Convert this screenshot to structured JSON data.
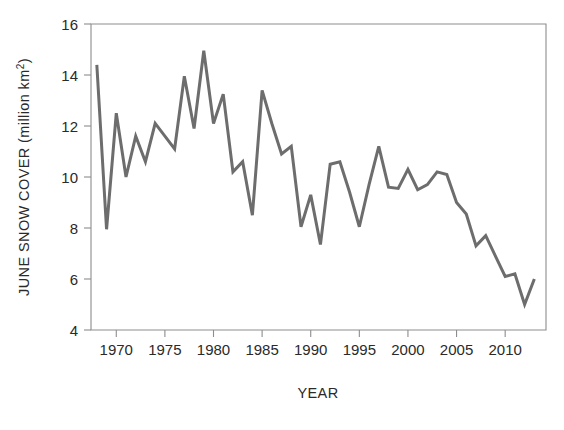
{
  "chart_data": {
    "type": "line",
    "title": "",
    "subtitle": "",
    "xlabel": "YEAR",
    "ylabel": "JUNE SNOW COVER (million km²)",
    "ylabel_main": "JUNE SNOW COVER (million km",
    "ylabel_sup": "2",
    "ylabel_tail": ")",
    "xlim": [
      1967.4,
      2014.2
    ],
    "ylim": [
      4,
      16
    ],
    "grid": false,
    "legend": null,
    "legend_position": "none",
    "line_color": "#6d6d6d",
    "line_width": 3.0,
    "frame_color": "#8d8d8d",
    "background_color": "#ffffff",
    "xticks": [
      1970,
      1975,
      1980,
      1985,
      1990,
      1995,
      2000,
      2005,
      2010
    ],
    "xtick_labels": [
      "1970",
      "1975",
      "1980",
      "1985",
      "1990",
      "1995",
      "2000",
      "2005",
      "2010"
    ],
    "yticks": [
      4,
      6,
      8,
      10,
      12,
      14,
      16
    ],
    "ytick_labels": [
      "4",
      "6",
      "8",
      "10",
      "12",
      "14",
      "16"
    ],
    "x": [
      1968,
      1969,
      1970,
      1971,
      1972,
      1973,
      1974,
      1975,
      1976,
      1977,
      1978,
      1979,
      1980,
      1981,
      1982,
      1983,
      1984,
      1985,
      1986,
      1987,
      1988,
      1989,
      1990,
      1991,
      1992,
      1993,
      1994,
      1995,
      1996,
      1997,
      1998,
      1999,
      2000,
      2001,
      2002,
      2003,
      2004,
      2005,
      2006,
      2007,
      2008,
      2009,
      2010,
      2011,
      2012,
      2013
    ],
    "y": [
      14.4,
      7.95,
      12.5,
      10.0,
      11.6,
      10.6,
      12.1,
      11.6,
      11.1,
      13.95,
      11.9,
      14.95,
      12.1,
      13.25,
      10.2,
      10.6,
      8.5,
      13.4,
      12.1,
      10.9,
      11.2,
      8.05,
      9.3,
      7.35,
      10.5,
      10.6,
      9.4,
      8.05,
      9.7,
      11.2,
      9.6,
      9.55,
      10.3,
      9.5,
      9.7,
      10.2,
      10.1,
      9.0,
      8.55,
      7.3,
      7.7,
      6.9,
      6.1,
      6.2,
      5.0,
      6.0
    ],
    "series": [
      {
        "name": "June snow cover extent",
        "color": "#6d6d6d",
        "values": [
          14.4,
          7.95,
          12.5,
          10.0,
          11.6,
          10.6,
          12.1,
          11.6,
          11.1,
          13.95,
          11.9,
          14.95,
          12.1,
          13.25,
          10.2,
          10.6,
          8.5,
          13.4,
          12.1,
          10.9,
          11.2,
          8.05,
          9.3,
          7.35,
          10.5,
          10.6,
          9.4,
          8.05,
          9.7,
          11.2,
          9.6,
          9.55,
          10.3,
          9.5,
          9.7,
          10.2,
          10.1,
          9.0,
          8.55,
          7.3,
          7.7,
          6.9,
          6.1,
          6.2,
          5.0,
          6.0
        ]
      }
    ],
    "annotations": []
  }
}
